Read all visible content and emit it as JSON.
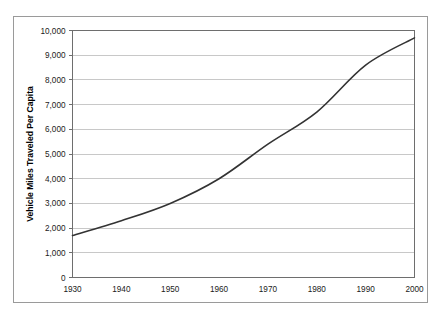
{
  "figure": {
    "background_color": "#ffffff",
    "frame_color": "#9a9a9a"
  },
  "chart_data": {
    "type": "line",
    "title": "",
    "xlabel": "",
    "ylabel": "Vehicle Miles Traveled Per Capita",
    "xlim": [
      1930,
      2000
    ],
    "ylim": [
      0,
      10000
    ],
    "grid": true,
    "grid_axis": "y",
    "legend": false,
    "x": [
      1930,
      1940,
      1950,
      1960,
      1970,
      1980,
      1990,
      2000
    ],
    "values": [
      1700,
      2300,
      3000,
      4000,
      5400,
      6700,
      8600,
      9700
    ],
    "series": [
      {
        "name": "Vehicle Miles Traveled Per Capita",
        "values": [
          1700,
          2300,
          3000,
          4000,
          5400,
          6700,
          8600,
          9700
        ],
        "color": "#333333",
        "line_width": 1.6,
        "markers": false
      }
    ],
    "xticks": [
      1930,
      1940,
      1950,
      1960,
      1970,
      1980,
      1990,
      2000
    ],
    "xtick_labels": [
      "1930",
      "1940",
      "1950",
      "1960",
      "1970",
      "1980",
      "1990",
      "2000"
    ],
    "yticks": [
      0,
      1000,
      2000,
      3000,
      4000,
      5000,
      6000,
      7000,
      8000,
      9000,
      10000
    ],
    "ytick_labels": [
      "0",
      "1,000",
      "2,000",
      "3,000",
      "4,000",
      "5,000",
      "6,000",
      "7,000",
      "8,000",
      "9,000",
      "10,000"
    ],
    "colors": {
      "line": "#333333",
      "gridline": "#c8c8c8",
      "axis": "#6e6e6e",
      "text": "#1a1a1a"
    }
  }
}
